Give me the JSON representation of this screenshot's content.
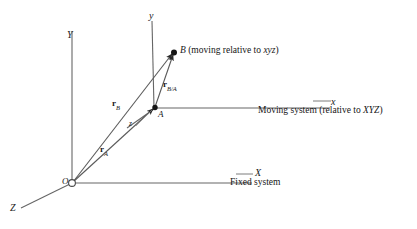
{
  "figure": {
    "type": "vector-kinematics-diagram",
    "stroke_color": "#555555",
    "text_color": "#1a1a1a"
  },
  "fixed_frame": {
    "origin_label": "O",
    "axes": [
      {
        "name": "Y",
        "label": "Y"
      },
      {
        "name": "X",
        "label": "X"
      },
      {
        "name": "Z",
        "label": "Z"
      }
    ],
    "caption": "Fixed system"
  },
  "moving_frame": {
    "origin_label": "A",
    "axes": [
      {
        "name": "y",
        "label": "y"
      },
      {
        "name": "x",
        "label": "x"
      },
      {
        "name": "z",
        "label": "z"
      }
    ],
    "caption_prefix": "Moving system (relative to ",
    "caption_frame": "XYZ",
    "caption_suffix": ")"
  },
  "points": [
    {
      "name": "B",
      "label": "B",
      "annotation_prefix": " (moving relative to ",
      "annotation_frame": "xyz",
      "annotation_suffix": ")"
    }
  ],
  "vectors": [
    {
      "name": "r_A",
      "symbol": "r",
      "subscript": "A",
      "from": "O",
      "to": "A"
    },
    {
      "name": "r_B",
      "symbol": "r",
      "subscript": "B",
      "from": "O",
      "to": "B"
    },
    {
      "name": "r_B_over_A",
      "symbol": "r",
      "subscript": "B/A",
      "from": "A",
      "to": "B"
    }
  ]
}
